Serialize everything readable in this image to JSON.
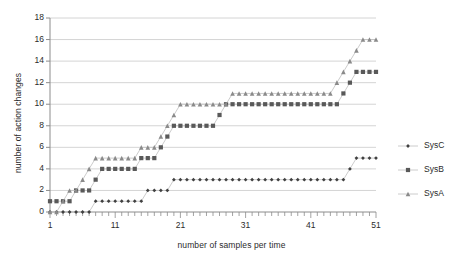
{
  "chart_data": {
    "type": "line",
    "title": "",
    "xlabel": "number of samples per time",
    "ylabel": "number of action changes",
    "xlim": [
      1,
      51
    ],
    "ylim": [
      0,
      18
    ],
    "yticks": [
      0,
      2,
      4,
      6,
      8,
      10,
      12,
      14,
      16,
      18
    ],
    "xticks": [
      1,
      11,
      21,
      31,
      41,
      51
    ],
    "x_minor_tick_step": 1,
    "grid": "horizontal",
    "legend_position": "right",
    "marker_color": "#595959",
    "line_color": "#bfbfbf",
    "series": [
      {
        "name": "SysC",
        "marker": "diamond",
        "x": [
          1,
          2,
          3,
          4,
          5,
          6,
          7,
          8,
          9,
          10,
          11,
          12,
          13,
          14,
          15,
          16,
          17,
          18,
          19,
          20,
          21,
          22,
          23,
          24,
          25,
          26,
          27,
          28,
          29,
          30,
          31,
          32,
          33,
          34,
          35,
          36,
          37,
          38,
          39,
          40,
          41,
          42,
          43,
          44,
          45,
          46,
          47,
          48,
          49,
          50,
          51
        ],
        "values": [
          0,
          0,
          0,
          0,
          0,
          0,
          0,
          1,
          1,
          1,
          1,
          1,
          1,
          1,
          1,
          2,
          2,
          2,
          2,
          3,
          3,
          3,
          3,
          3,
          3,
          3,
          3,
          3,
          3,
          3,
          3,
          3,
          3,
          3,
          3,
          3,
          3,
          3,
          3,
          3,
          3,
          3,
          3,
          3,
          3,
          3,
          4,
          5,
          5,
          5,
          5
        ]
      },
      {
        "name": "SysB",
        "marker": "square",
        "x": [
          1,
          2,
          3,
          4,
          5,
          6,
          7,
          8,
          9,
          10,
          11,
          12,
          13,
          14,
          15,
          16,
          17,
          18,
          19,
          20,
          21,
          22,
          23,
          24,
          25,
          26,
          27,
          28,
          29,
          30,
          31,
          32,
          33,
          34,
          35,
          36,
          37,
          38,
          39,
          40,
          41,
          42,
          43,
          44,
          45,
          46,
          47,
          48,
          49,
          50,
          51
        ],
        "values": [
          1,
          1,
          1,
          1,
          2,
          2,
          2,
          3,
          4,
          4,
          4,
          4,
          4,
          4,
          5,
          5,
          5,
          6,
          7,
          8,
          8,
          8,
          8,
          8,
          8,
          8,
          9,
          10,
          10,
          10,
          10,
          10,
          10,
          10,
          10,
          10,
          10,
          10,
          10,
          10,
          10,
          10,
          10,
          10,
          10,
          11,
          12,
          13,
          13,
          13,
          13
        ]
      },
      {
        "name": "SysA",
        "marker": "triangle",
        "x": [
          1,
          2,
          3,
          4,
          5,
          6,
          7,
          8,
          9,
          10,
          11,
          12,
          13,
          14,
          15,
          16,
          17,
          18,
          19,
          20,
          21,
          22,
          23,
          24,
          25,
          26,
          27,
          28,
          29,
          30,
          31,
          32,
          33,
          34,
          35,
          36,
          37,
          38,
          39,
          40,
          41,
          42,
          43,
          44,
          45,
          46,
          47,
          48,
          49,
          50,
          51
        ],
        "values": [
          0,
          0,
          1,
          2,
          2,
          3,
          4,
          5,
          5,
          5,
          5,
          5,
          5,
          5,
          6,
          6,
          6,
          7,
          8,
          9,
          10,
          10,
          10,
          10,
          10,
          10,
          10,
          10,
          11,
          11,
          11,
          11,
          11,
          11,
          11,
          11,
          11,
          11,
          11,
          11,
          11,
          11,
          11,
          11,
          12,
          13,
          14,
          15,
          16,
          16,
          16
        ]
      }
    ]
  }
}
